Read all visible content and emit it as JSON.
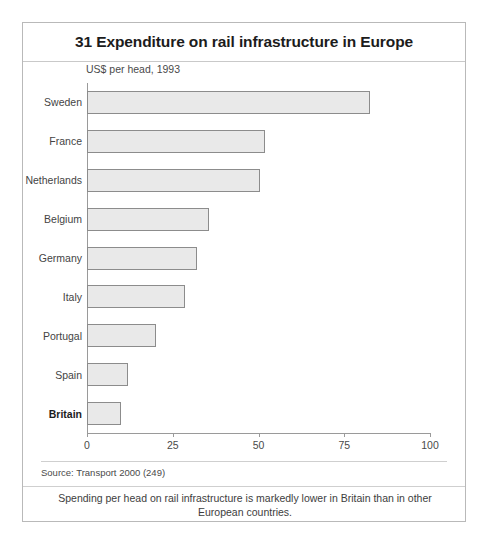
{
  "figure": {
    "title": "31 Expenditure on rail infrastructure in Europe",
    "subtitle": "US$ per head, 1993",
    "source": "Source: Transport 2000 (249)",
    "caption": "Spending per head on rail infrastructure is markedly lower in Britain than in other European countries.",
    "colors": {
      "bar_fill": "#e9e9e9",
      "bar_border": "#8c8c8c",
      "frame": "#b9b9b9",
      "axis": "#9a9a9a",
      "text": "#2b2b2b"
    }
  },
  "chart_data": {
    "type": "bar",
    "orientation": "horizontal",
    "title": "31 Expenditure on rail infrastructure in Europe",
    "subtitle": "US$ per head, 1993",
    "xlabel": "",
    "ylabel": "",
    "xlim": [
      0,
      100
    ],
    "xticks": [
      0,
      25,
      50,
      75,
      100
    ],
    "xtick_labels": [
      "0",
      "25",
      "50",
      "75",
      "100"
    ],
    "grid": false,
    "legend": false,
    "categories": [
      "Sweden",
      "France",
      "Netherlands",
      "Belgium",
      "Germany",
      "Italy",
      "Portugal",
      "Spain",
      "Britain"
    ],
    "values": [
      82.5,
      52,
      50.5,
      35.5,
      32,
      28.5,
      20,
      12,
      10
    ],
    "emphasis_category": "Britain",
    "bars": [
      {
        "label": "Sweden",
        "value": 82.5,
        "emphasis": false
      },
      {
        "label": "France",
        "value": 52,
        "emphasis": false
      },
      {
        "label": "Netherlands",
        "value": 50.5,
        "emphasis": false
      },
      {
        "label": "Belgium",
        "value": 35.5,
        "emphasis": false
      },
      {
        "label": "Germany",
        "value": 32,
        "emphasis": false
      },
      {
        "label": "Italy",
        "value": 28.5,
        "emphasis": false
      },
      {
        "label": "Portugal",
        "value": 20,
        "emphasis": false
      },
      {
        "label": "Spain",
        "value": 12,
        "emphasis": false
      },
      {
        "label": "Britain",
        "value": 10,
        "emphasis": true
      }
    ]
  }
}
